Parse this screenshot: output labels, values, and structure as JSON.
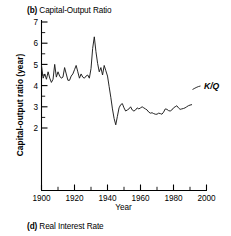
{
  "panel": {
    "tag": "(b)",
    "title": "Capital-Output Ratio",
    "full_title": "(b) Capital-Output Ratio"
  },
  "next_panel": {
    "tag": "(d)",
    "title": "Real Interest Rate",
    "full_title": "(d) Real Interest Rate"
  },
  "axes": {
    "ylabel": "Capital-output ratio (year)",
    "xlabel": "Year",
    "ytick_labels": [
      "7",
      "6",
      "5",
      "4",
      "3",
      "2"
    ],
    "xtick_labels": [
      "1900",
      "1920",
      "1940",
      "1960",
      "1980",
      "2000"
    ]
  },
  "series_annotation": {
    "label": "K/Q"
  },
  "chart_data": {
    "type": "line",
    "title": "(b) Capital-Output Ratio",
    "xlabel": "Year",
    "ylabel": "Capital-output ratio (year)",
    "xlim": [
      1900,
      2000
    ],
    "ylim": [
      0,
      7
    ],
    "ytick_values": [
      2,
      3,
      4,
      5,
      6,
      7
    ],
    "yminor_step": 0.5,
    "xtick_values": [
      1900,
      1920,
      1940,
      1960,
      1980,
      2000
    ],
    "xminor_step": 10,
    "grid": false,
    "legend_position": "inline-right",
    "annotations": [
      {
        "text": "K/Q",
        "x": 1995,
        "y": 3.15,
        "italic": true
      }
    ],
    "series": [
      {
        "name": "K/Q",
        "label": "Capital-output ratio",
        "x": [
          1900,
          1901,
          1902,
          1903,
          1904,
          1905,
          1906,
          1907,
          1908,
          1909,
          1910,
          1911,
          1912,
          1913,
          1914,
          1915,
          1916,
          1917,
          1918,
          1919,
          1920,
          1921,
          1922,
          1923,
          1924,
          1925,
          1926,
          1927,
          1928,
          1929,
          1930,
          1931,
          1932,
          1933,
          1934,
          1935,
          1936,
          1937,
          1938,
          1939,
          1940,
          1941,
          1942,
          1943,
          1944,
          1945,
          1946,
          1947,
          1948,
          1949,
          1950,
          1951,
          1952,
          1953,
          1954,
          1955,
          1956,
          1957,
          1958,
          1959,
          1960,
          1961,
          1962,
          1963,
          1964,
          1965,
          1966,
          1967,
          1968,
          1969,
          1970,
          1971,
          1972,
          1973,
          1974,
          1975,
          1976,
          1977,
          1978,
          1979,
          1980,
          1981,
          1982,
          1983,
          1984,
          1985,
          1986,
          1987,
          1988,
          1989,
          1990,
          1991
        ],
        "values": [
          4.95,
          4.35,
          4.55,
          4.3,
          4.65,
          4.35,
          4.15,
          4.3,
          5.0,
          4.4,
          4.65,
          4.45,
          4.35,
          4.4,
          4.85,
          4.55,
          4.25,
          4.25,
          4.45,
          4.55,
          4.75,
          4.95,
          4.65,
          4.35,
          4.55,
          4.4,
          4.35,
          4.45,
          4.5,
          4.35,
          4.8,
          5.75,
          6.3,
          5.6,
          5.05,
          4.65,
          4.85,
          4.5,
          4.95,
          4.7,
          4.45,
          3.95,
          3.45,
          2.9,
          2.45,
          2.15,
          2.55,
          2.95,
          3.1,
          3.15,
          2.95,
          2.8,
          2.85,
          2.9,
          3.0,
          2.85,
          2.8,
          2.85,
          2.95,
          2.9,
          2.95,
          3.0,
          2.95,
          2.9,
          2.85,
          2.75,
          2.7,
          2.72,
          2.68,
          2.65,
          2.65,
          2.7,
          2.68,
          2.65,
          2.75,
          2.9,
          2.88,
          2.82,
          2.8,
          2.85,
          2.95,
          3.0,
          3.05,
          2.95,
          2.88,
          2.9,
          2.92,
          2.95,
          3.0,
          3.05,
          3.08,
          3.1
        ]
      }
    ]
  }
}
